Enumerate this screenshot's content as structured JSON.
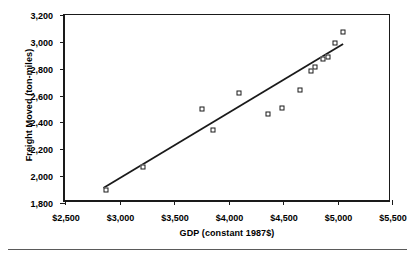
{
  "chart_data": {
    "type": "scatter",
    "title": "",
    "xlabel": "GDP (constant 1987$)",
    "ylabel": "Freight Moved (ton-miles)",
    "xlim": [
      2500,
      5500
    ],
    "ylim": [
      1800,
      3200
    ],
    "xticks": [
      "$2,500",
      "$3,000",
      "$3,500",
      "$4,000",
      "$4,500",
      "$5,000",
      "$5,500"
    ],
    "xtick_values": [
      2500,
      3000,
      3500,
      4000,
      4500,
      5000,
      5500
    ],
    "yticks": [
      "1,800",
      "2,000",
      "2,200",
      "2,400",
      "2,600",
      "2,800",
      "3,000",
      "3,200"
    ],
    "ytick_values": [
      1800,
      2000,
      2200,
      2400,
      2600,
      2800,
      3000,
      3200
    ],
    "grid": false,
    "legend": null,
    "marker": "open-square",
    "series": [
      {
        "name": "Freight vs GDP",
        "points": [
          {
            "x": 2875,
            "y": 1900
          },
          {
            "x": 3215,
            "y": 2065
          },
          {
            "x": 3755,
            "y": 2500
          },
          {
            "x": 3860,
            "y": 2340
          },
          {
            "x": 4095,
            "y": 2620
          },
          {
            "x": 4360,
            "y": 2465
          },
          {
            "x": 4490,
            "y": 2505
          },
          {
            "x": 4655,
            "y": 2645
          },
          {
            "x": 4760,
            "y": 2785
          },
          {
            "x": 4795,
            "y": 2815
          },
          {
            "x": 4865,
            "y": 2870
          },
          {
            "x": 4910,
            "y": 2890
          },
          {
            "x": 4975,
            "y": 2990
          },
          {
            "x": 5050,
            "y": 3070
          }
        ]
      }
    ],
    "trendline": {
      "name": "linear fit",
      "x0": 2855,
      "y0": 1890,
      "x1": 5075,
      "y1": 2980
    }
  }
}
